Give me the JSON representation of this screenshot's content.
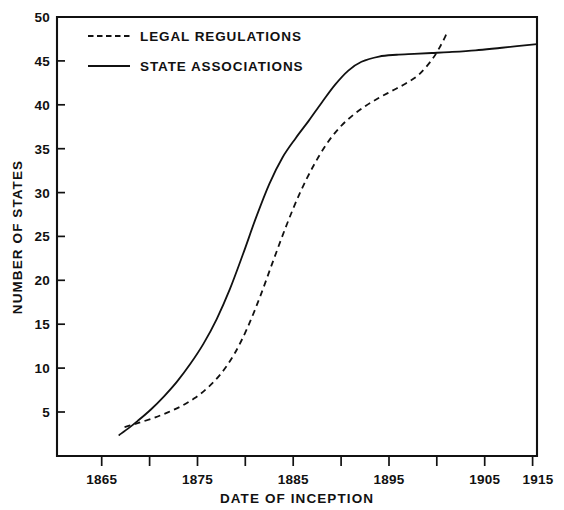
{
  "chart_data": {
    "type": "line",
    "title": "",
    "xlabel": "DATE OF INCEPTION",
    "ylabel": "NUMBER OF STATES",
    "xlim": [
      1860.3,
      1915.0
    ],
    "ylim": [
      0.0,
      50.0
    ],
    "grid": false,
    "legend_position": "top-center",
    "x_major_ticks": [
      1865,
      1875,
      1885,
      1895,
      1905,
      1915
    ],
    "x_major_tick_labels": [
      "1865",
      "1875",
      "1885",
      "1895",
      "1905",
      "1915"
    ],
    "x_minor_ticks": [
      1870,
      1880,
      1890,
      1900,
      1910
    ],
    "y_ticks": [
      5,
      10,
      15,
      20,
      25,
      30,
      35,
      40,
      45,
      50
    ],
    "y_tick_labels": [
      "5",
      "10",
      "15",
      "20",
      "25",
      "30",
      "35",
      "40",
      "45",
      "50"
    ],
    "series": [
      {
        "name": "LEGAL REGULATIONS",
        "style": "dashed",
        "color": "#111111",
        "x": [
          1868.0,
          1869.0,
          1870.0,
          1871.5,
          1873.0,
          1874.5,
          1876.0,
          1877.5,
          1879.0,
          1880.5,
          1882.0,
          1883.5,
          1885.0,
          1886.5,
          1888.0,
          1889.5,
          1891.0,
          1892.5,
          1894.0,
          1895.5,
          1897.0,
          1898.5,
          1900.0,
          1901.5,
          1903.0,
          1904.0,
          1904.7
        ],
        "y": [
          3.3,
          3.6,
          3.9,
          4.4,
          5.0,
          5.7,
          6.6,
          7.8,
          9.4,
          11.6,
          14.6,
          18.3,
          22.4,
          26.4,
          30.0,
          33.0,
          35.5,
          37.4,
          38.8,
          39.9,
          40.8,
          41.6,
          42.4,
          43.4,
          45.1,
          46.7,
          48.1
        ]
      },
      {
        "name": "STATE ASSOCIATIONS",
        "style": "solid",
        "color": "#111111",
        "x": [
          1867.4,
          1868.5,
          1869.5,
          1871.0,
          1872.5,
          1874.0,
          1875.5,
          1877.0,
          1878.5,
          1880.0,
          1881.5,
          1883.0,
          1884.5,
          1886.0,
          1887.5,
          1889.0,
          1890.5,
          1892.0,
          1893.5,
          1895.0,
          1897.0,
          1899.0,
          1901.0,
          1903.0,
          1905.0,
          1908.0,
          1911.0,
          1915.0
        ],
        "y": [
          2.4,
          3.2,
          4.0,
          5.3,
          6.8,
          8.5,
          10.5,
          12.8,
          15.6,
          19.0,
          23.0,
          27.2,
          31.0,
          34.0,
          36.2,
          38.2,
          40.3,
          42.3,
          43.9,
          44.9,
          45.5,
          45.7,
          45.8,
          45.9,
          46.0,
          46.2,
          46.5,
          46.9
        ]
      }
    ],
    "legend_entries": [
      {
        "label": "LEGAL REGULATIONS",
        "style": "dashed"
      },
      {
        "label": "STATE ASSOCIATIONS",
        "style": "solid"
      }
    ]
  }
}
